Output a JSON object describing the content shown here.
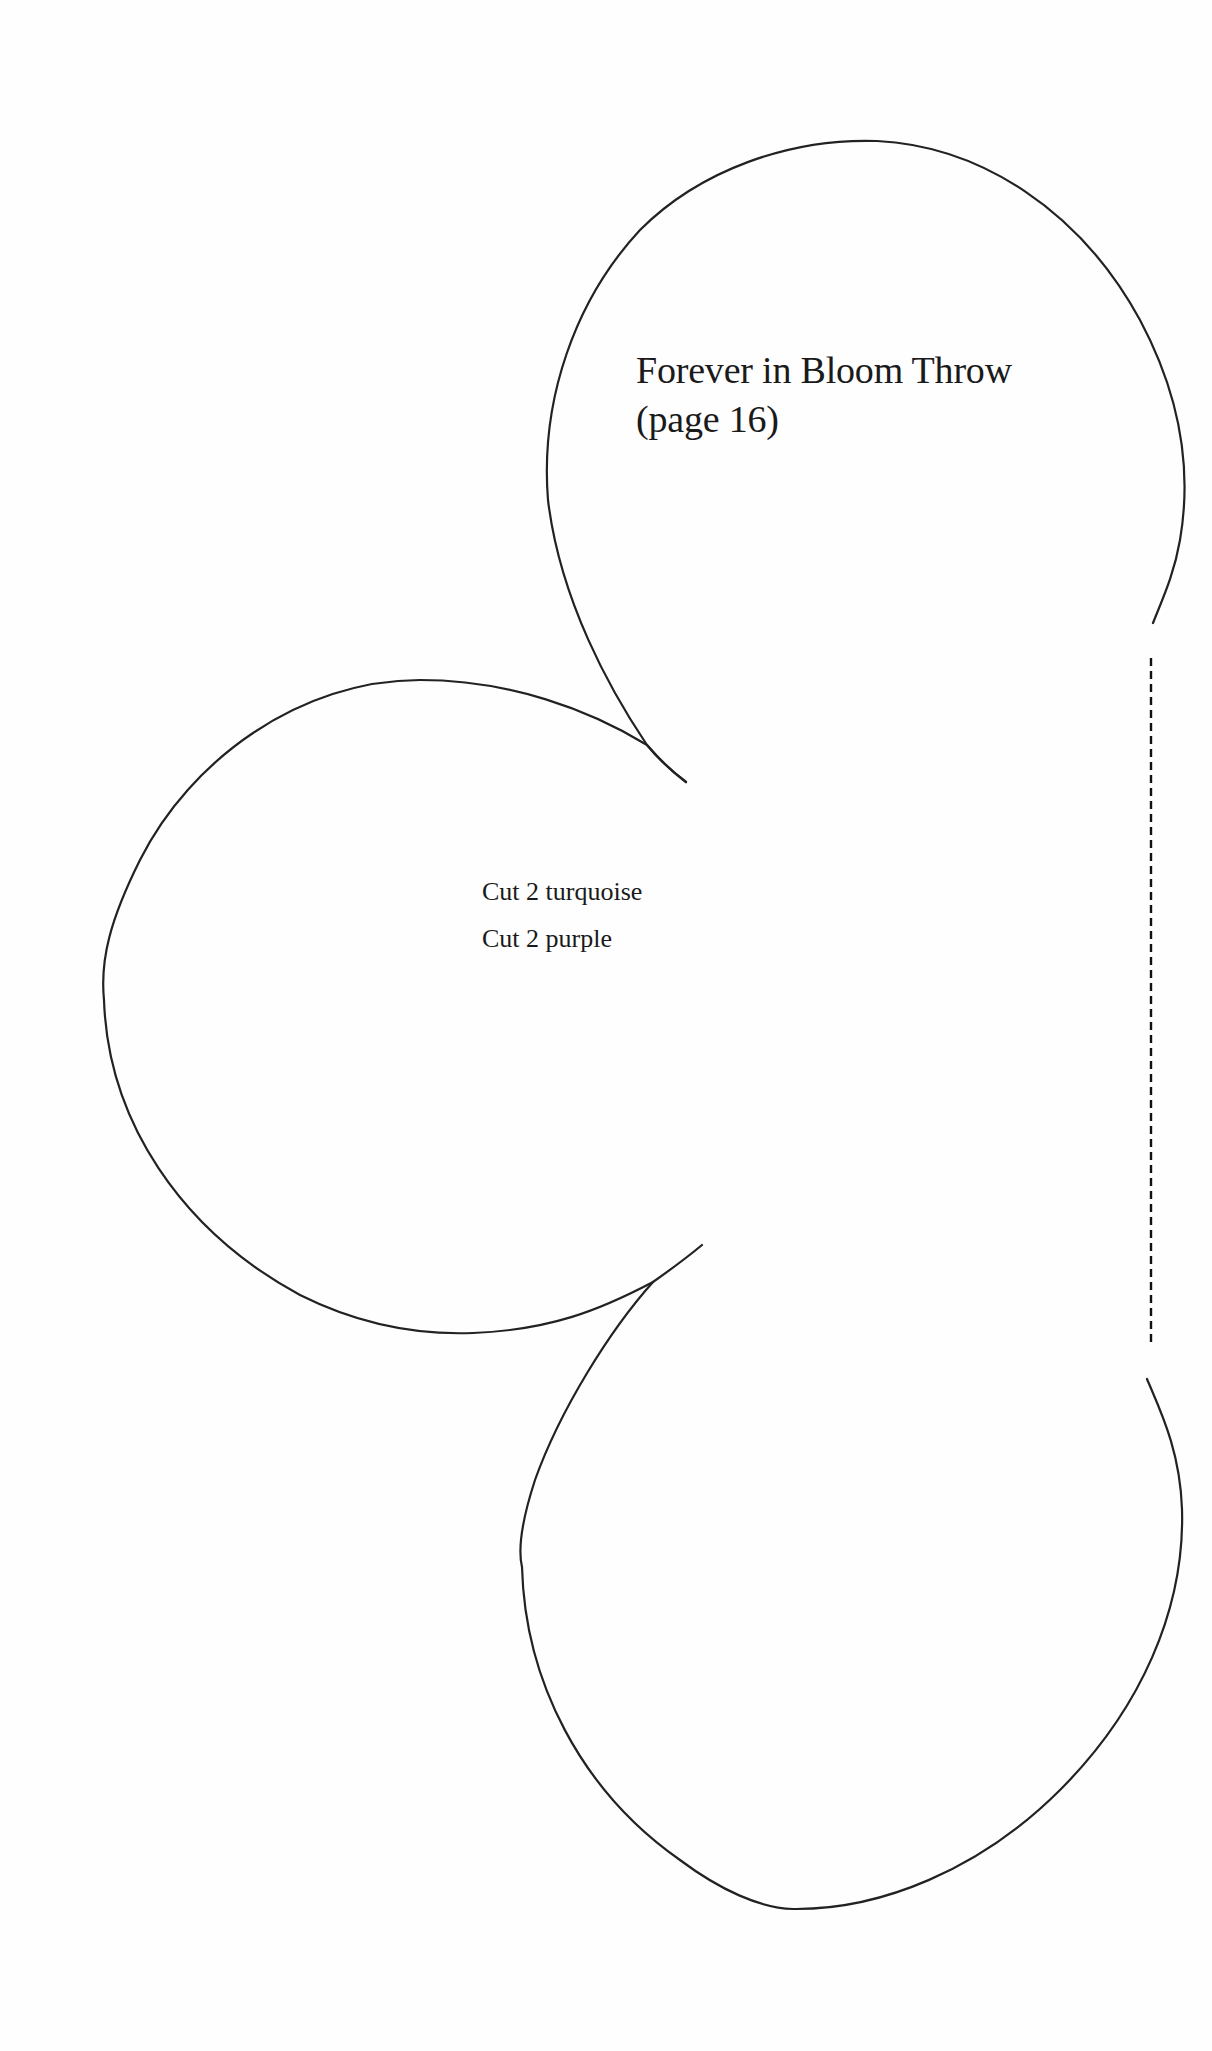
{
  "pattern": {
    "title_line1": "Forever in Bloom Throw",
    "title_line2": "(page 16)",
    "instructions": [
      "Cut 2 turquoise",
      "Cut 2 purple"
    ],
    "stroke_color": "#222222",
    "fold_line": "dashed"
  }
}
